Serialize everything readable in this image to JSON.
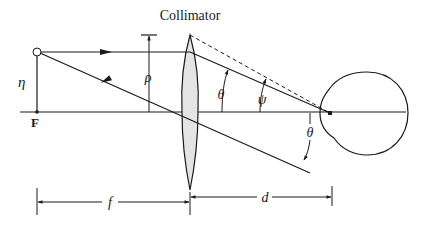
{
  "diagram": {
    "title": "Collimator",
    "labels": {
      "eta": "η",
      "focal_point": "F",
      "rho": "ρ",
      "theta_upper": "θ",
      "psi": "ψ",
      "theta_lower": "θ",
      "focal_length": "f",
      "distance": "d"
    },
    "components": [
      "object point",
      "collimator lens",
      "eye",
      "optical axis"
    ],
    "colors": {
      "line": "#1a1a1a",
      "lens_fill": "#e4e4e4",
      "background": "#ffffff"
    }
  }
}
